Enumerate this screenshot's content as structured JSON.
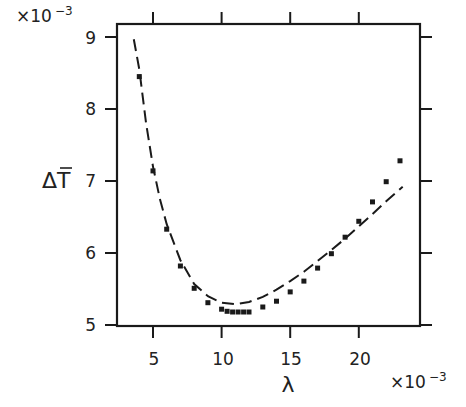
{
  "chart_data": {
    "type": "scatter",
    "title": "",
    "xlabel": "λ",
    "ylabel": "ΔT̄",
    "x_multiplier": "×10",
    "x_multiplier_exp": "−3",
    "y_multiplier": "×10",
    "y_multiplier_exp": "−3",
    "xlim": [
      2.4,
      24.5
    ],
    "ylim": [
      5.0,
      9.2
    ],
    "x_ticks": [
      5,
      10,
      15,
      20
    ],
    "y_ticks": [
      5,
      6,
      7,
      8,
      9
    ],
    "grid": false,
    "legend": null,
    "series": [
      {
        "name": "data points",
        "style": "square-markers",
        "x": [
          4.0,
          5.0,
          6.0,
          7.0,
          8.0,
          9.0,
          10.0,
          10.4,
          10.8,
          11.2,
          11.6,
          12.0,
          13.0,
          14.0,
          15.0,
          16.0,
          17.0,
          18.0,
          19.0,
          20.0,
          21.0,
          22.0,
          23.0
        ],
        "y": [
          8.45,
          7.14,
          6.33,
          5.82,
          5.51,
          5.31,
          5.22,
          5.19,
          5.18,
          5.18,
          5.18,
          5.18,
          5.25,
          5.33,
          5.46,
          5.61,
          5.79,
          5.99,
          6.22,
          6.44,
          6.71,
          6.99,
          7.28
        ]
      },
      {
        "name": "fit curve",
        "style": "dashed-line",
        "x": [
          3.6,
          4.0,
          4.5,
          5.0,
          5.5,
          6.0,
          7.0,
          8.0,
          9.0,
          10.0,
          11.0,
          12.0,
          13.0,
          14.0,
          15.0,
          16.0,
          17.0,
          18.0,
          19.0,
          20.0,
          21.0,
          22.0,
          23.2
        ],
        "y": [
          8.97,
          8.55,
          7.8,
          7.2,
          6.75,
          6.4,
          5.9,
          5.57,
          5.4,
          5.31,
          5.29,
          5.32,
          5.39,
          5.49,
          5.61,
          5.74,
          5.89,
          6.04,
          6.2,
          6.37,
          6.54,
          6.72,
          6.92
        ]
      }
    ]
  },
  "axes": {
    "x_tick_labels": [
      "5",
      "10",
      "15",
      "20"
    ],
    "y_tick_labels": [
      "5",
      "6",
      "7",
      "8",
      "9"
    ],
    "x_label": "λ",
    "y_label_main": "ΔT",
    "x_multiplier_base": "×10",
    "x_multiplier_exp": "−3",
    "y_multiplier_base": "×10",
    "y_multiplier_exp": "−3"
  },
  "colors": {
    "ink": "#1a1a1a",
    "background": "#ffffff"
  }
}
